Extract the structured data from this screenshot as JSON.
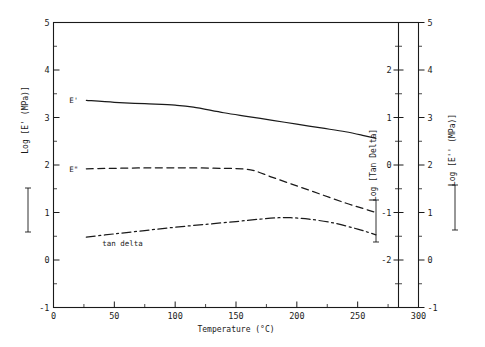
{
  "chart_data": {
    "type": "line",
    "title": "",
    "xlabel": "Temperature (°C)",
    "xlim": [
      0,
      300
    ],
    "xticks": [
      0,
      50,
      100,
      150,
      200,
      250,
      300
    ],
    "xticklabels": [
      "0",
      "50",
      "100",
      "150",
      "200",
      "250",
      "300"
    ],
    "xminor_step": 25,
    "grid": false,
    "legend": "inline-labels",
    "axes": [
      {
        "id": "left",
        "label": "Log [E' (MPa)]",
        "position": "left",
        "lim": [
          -1,
          5
        ],
        "ticks": [
          -1,
          0,
          1,
          2,
          3,
          4,
          5
        ],
        "ticklabels": [
          "-1",
          "0",
          "1",
          "2",
          "3",
          "4",
          "5"
        ],
        "minor_step": 0.5
      },
      {
        "id": "right-inner",
        "label": "Log [Tan Delta]",
        "position": "right-inner",
        "lim": [
          -3,
          3
        ],
        "ticks": [
          -2,
          -1,
          0,
          1,
          2
        ],
        "ticklabels": [
          "-2",
          "-1",
          "0",
          "1",
          "2"
        ],
        "minor_step": 0.5
      },
      {
        "id": "right-outer",
        "label": "Log [E'' (MPa)]",
        "position": "right-outer",
        "lim": [
          -1,
          5
        ],
        "ticks": [
          -1,
          0,
          1,
          2,
          3,
          4,
          5
        ],
        "ticklabels": [
          "-1",
          "0",
          "1",
          "2",
          "3",
          "4",
          "5"
        ],
        "minor_step": 0.5
      }
    ],
    "series": [
      {
        "name": "E'",
        "label": "E'",
        "axis": "left",
        "linestyle": "solid",
        "color": "#1a1a1a",
        "x": [
          27,
          50,
          75,
          100,
          115,
          140,
          160,
          180,
          200,
          220,
          240,
          255,
          265
        ],
        "y": [
          3.36,
          3.32,
          3.29,
          3.26,
          3.22,
          3.1,
          3.02,
          2.94,
          2.86,
          2.78,
          2.7,
          2.62,
          2.56
        ]
      },
      {
        "name": "E''",
        "label": "E\"",
        "axis": "left",
        "linestyle": "dashed",
        "color": "#1a1a1a",
        "x": [
          27,
          50,
          80,
          110,
          140,
          155,
          165,
          180,
          200,
          220,
          240,
          255,
          265
        ],
        "y": [
          1.92,
          1.93,
          1.94,
          1.94,
          1.93,
          1.92,
          1.88,
          1.74,
          1.56,
          1.38,
          1.2,
          1.08,
          1.0
        ]
      },
      {
        "name": "tan delta",
        "label": "tan delta",
        "axis": "left",
        "linestyle": "dashdot",
        "color": "#1a1a1a",
        "x": [
          27,
          50,
          75,
          100,
          125,
          150,
          170,
          185,
          195,
          210,
          230,
          250,
          265
        ],
        "y": [
          0.48,
          0.55,
          0.62,
          0.69,
          0.75,
          0.81,
          0.86,
          0.89,
          0.89,
          0.86,
          0.78,
          0.65,
          0.53
        ]
      }
    ],
    "annotations": [
      {
        "text": "E'",
        "x": 27,
        "y": 3.36,
        "role": "curve-label"
      },
      {
        "text": "E\"",
        "x": 27,
        "y": 1.92,
        "role": "curve-label"
      },
      {
        "text": "tan delta",
        "x": 40,
        "y": 0.3,
        "role": "curve-label"
      }
    ]
  }
}
